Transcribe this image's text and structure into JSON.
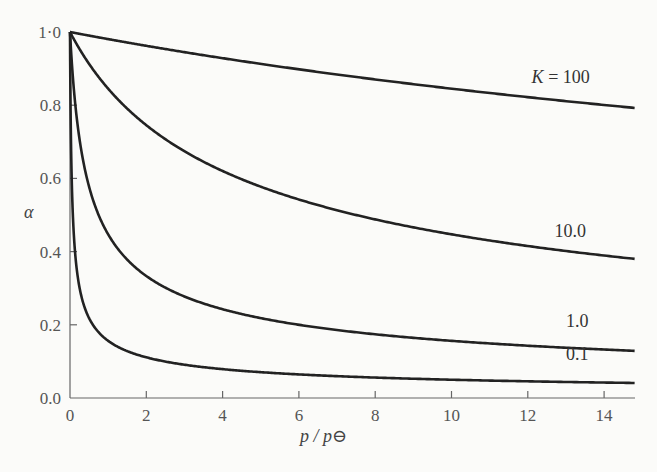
{
  "chart_data": {
    "type": "line",
    "title": "",
    "xlabel": "p / p⊖",
    "ylabel": "α",
    "xlim": [
      0,
      14.8
    ],
    "ylim": [
      0,
      1.0
    ],
    "grid": false,
    "legend": "inline curve labels at right end",
    "x_ticks": [
      "0",
      "2",
      "4",
      "6",
      "8",
      "10",
      "12",
      "14"
    ],
    "x_tick_values": [
      0,
      2,
      4,
      6,
      8,
      10,
      12,
      14
    ],
    "y_ticks": [
      "0.0",
      "0.2",
      "0.4",
      "0.6",
      "0.8",
      "1·0"
    ],
    "y_tick_values": [
      0,
      0.2,
      0.4,
      0.6,
      0.8,
      1.0
    ],
    "x": [
      0,
      0.02,
      0.05,
      0.1,
      0.2,
      0.3,
      0.5,
      0.75,
      1,
      1.5,
      2,
      3,
      4,
      5,
      6,
      8,
      10,
      12,
      14,
      14.8
    ],
    "series": [
      {
        "name": "K = 100",
        "label": "K = 100",
        "values": [
          1.0,
          1.0,
          1.0,
          0.998,
          0.996,
          0.994,
          0.99,
          0.985,
          0.981,
          0.972,
          0.962,
          0.945,
          0.928,
          0.913,
          0.898,
          0.87,
          0.845,
          0.822,
          0.801,
          0.793
        ]
      },
      {
        "name": "K = 10.0",
        "label": "10.0",
        "values": [
          1.0,
          0.996,
          0.99,
          0.981,
          0.962,
          0.945,
          0.913,
          0.877,
          0.845,
          0.791,
          0.745,
          0.674,
          0.62,
          0.577,
          0.542,
          0.488,
          0.447,
          0.415,
          0.389,
          0.38
        ]
      },
      {
        "name": "K = 1.0",
        "label": "1.0",
        "values": [
          1.0,
          0.962,
          0.913,
          0.845,
          0.745,
          0.674,
          0.577,
          0.5,
          0.447,
          0.378,
          0.333,
          0.277,
          0.243,
          0.218,
          0.2,
          0.174,
          0.156,
          0.143,
          0.132,
          0.129
        ]
      },
      {
        "name": "K = 0.1",
        "label": "0.1",
        "values": [
          1.0,
          0.745,
          0.577,
          0.447,
          0.333,
          0.277,
          0.218,
          0.18,
          0.156,
          0.128,
          0.111,
          0.091,
          0.079,
          0.071,
          0.064,
          0.056,
          0.05,
          0.046,
          0.042,
          0.041
        ]
      }
    ],
    "label_positions": [
      {
        "series": 0,
        "x": 12.1,
        "y": 0.86
      },
      {
        "series": 1,
        "x": 12.7,
        "y": 0.44
      },
      {
        "series": 2,
        "x": 13.0,
        "y": 0.195
      },
      {
        "series": 3,
        "x": 13.0,
        "y": 0.105
      }
    ]
  }
}
